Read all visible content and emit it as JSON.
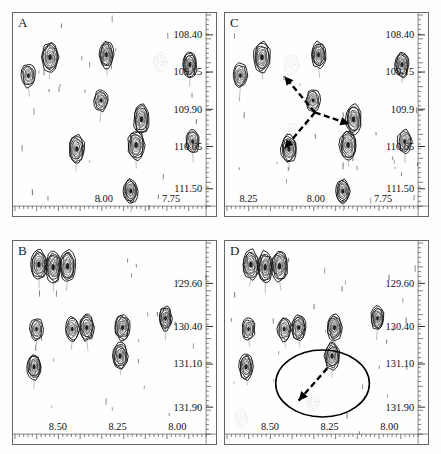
{
  "figure": {
    "background_color": "#fdfdfd",
    "contour_color": "#111111",
    "annotation_color": "#000000"
  },
  "panels": [
    {
      "letter": "A",
      "name": "panel-a",
      "x_axis": {
        "label": "",
        "ticks": [
          "8.00",
          "7.75"
        ],
        "tick_positions": [
          0.47,
          0.8
        ],
        "range": [
          8.33,
          7.62
        ]
      },
      "y_axis": {
        "label": "",
        "ticks": [
          "108.40",
          "109.15",
          "109.90",
          "110.65",
          "111.50"
        ],
        "tick_positions": [
          0.1,
          0.315,
          0.53,
          0.735,
          0.915
        ],
        "range": [
          108.0,
          111.85
        ]
      },
      "annotations": []
    },
    {
      "letter": "C",
      "name": "panel-c",
      "x_axis": {
        "label": "",
        "ticks": [
          "8.25",
          "8.00",
          "7.75"
        ],
        "tick_positions": [
          0.045,
          0.47,
          0.8
        ],
        "range": [
          8.33,
          7.62
        ]
      },
      "y_axis": {
        "label": "",
        "ticks": [
          "108.40",
          "109.15",
          "109.9",
          "110.65",
          "111.50"
        ],
        "tick_positions": [
          0.1,
          0.315,
          0.53,
          0.735,
          0.915
        ],
        "range": [
          108.0,
          111.85
        ]
      },
      "annotations": [
        {
          "type": "dashed-double-arrow",
          "name": "noe-arrow-upleft",
          "from": [
            0.46,
            0.51
          ],
          "to": [
            0.3,
            0.32
          ]
        },
        {
          "type": "dashed-double-arrow",
          "name": "noe-arrow-downleft",
          "from": [
            0.46,
            0.51
          ],
          "to": [
            0.3,
            0.7
          ]
        },
        {
          "type": "dashed-double-arrow",
          "name": "noe-arrow-right",
          "from": [
            0.46,
            0.51
          ],
          "to": [
            0.64,
            0.57
          ]
        }
      ]
    },
    {
      "letter": "B",
      "name": "panel-b",
      "x_axis": {
        "label": "",
        "ticks": [
          "8.50",
          "8.25",
          "8.00"
        ],
        "tick_positions": [
          0.18,
          0.5,
          0.8
        ],
        "range": [
          8.68,
          7.88
        ]
      },
      "y_axis": {
        "label": "",
        "ticks": [
          "129.60",
          "130.40",
          "131.10",
          "131.90"
        ],
        "tick_positions": [
          0.21,
          0.44,
          0.645,
          0.855
        ],
        "range": [
          128.85,
          132.4
        ]
      },
      "annotations": []
    },
    {
      "letter": "D",
      "name": "panel-d",
      "x_axis": {
        "label": "",
        "ticks": [
          "8.50",
          "8.25",
          "8.00"
        ],
        "tick_positions": [
          0.18,
          0.5,
          0.8
        ],
        "range": [
          8.68,
          7.88
        ]
      },
      "y_axis": {
        "label": "",
        "ticks": [
          "129.60",
          "130.40",
          "131.10",
          "131.90"
        ],
        "tick_positions": [
          0.21,
          0.44,
          0.645,
          0.855
        ],
        "range": [
          128.85,
          132.4
        ]
      },
      "annotations": [
        {
          "type": "ellipse-highlight",
          "name": "highlight-ellipse",
          "center": [
            0.5,
            0.735
          ],
          "radius": [
            0.245,
            0.175
          ]
        },
        {
          "type": "dashed-arrow",
          "name": "noe-arrow-downleft",
          "from": [
            0.525,
            0.655
          ],
          "to": [
            0.375,
            0.825
          ]
        }
      ]
    }
  ],
  "chart_data": {
    "type": "scatter",
    "title": "",
    "xlabel": "",
    "ylabel": "",
    "panels": [
      {
        "id": "A",
        "xlim": [
          8.33,
          7.62
        ],
        "ylim": [
          108.0,
          111.85
        ],
        "xticks": [
          8.0,
          7.75
        ],
        "yticks": [
          108.4,
          109.15,
          109.9,
          110.65,
          111.5
        ],
        "peaks": [
          {
            "x": 8.2,
            "y": 108.85,
            "intensity": "strong",
            "w": 17,
            "h": 30
          },
          {
            "x": 8.28,
            "y": 109.22,
            "intensity": "medium",
            "w": 14,
            "h": 24
          },
          {
            "x": 7.99,
            "y": 108.8,
            "intensity": "strong",
            "w": 14,
            "h": 27
          },
          {
            "x": 7.79,
            "y": 108.95,
            "intensity": "weak-dotted",
            "w": 14,
            "h": 20
          },
          {
            "x": 7.68,
            "y": 109.0,
            "intensity": "strong",
            "w": 14,
            "h": 26
          },
          {
            "x": 8.01,
            "y": 109.72,
            "intensity": "medium",
            "w": 14,
            "h": 22
          },
          {
            "x": 7.86,
            "y": 110.1,
            "intensity": "strong",
            "w": 16,
            "h": 30
          },
          {
            "x": 7.67,
            "y": 110.55,
            "intensity": "medium",
            "w": 14,
            "h": 24
          },
          {
            "x": 7.88,
            "y": 110.62,
            "intensity": "strong",
            "w": 17,
            "h": 30
          },
          {
            "x": 8.1,
            "y": 110.7,
            "intensity": "strong",
            "w": 16,
            "h": 28
          },
          {
            "x": 7.9,
            "y": 111.55,
            "intensity": "strong",
            "w": 14,
            "h": 24
          }
        ]
      },
      {
        "id": "C",
        "xlim": [
          8.33,
          7.62
        ],
        "ylim": [
          108.0,
          111.85
        ],
        "xticks": [
          8.25,
          8.0,
          7.75
        ],
        "yticks": [
          108.4,
          109.15,
          109.9,
          110.65,
          111.5
        ],
        "peaks": [
          {
            "x": 8.2,
            "y": 108.85,
            "intensity": "strong",
            "w": 17,
            "h": 30
          },
          {
            "x": 8.28,
            "y": 109.22,
            "intensity": "medium",
            "w": 14,
            "h": 24
          },
          {
            "x": 7.99,
            "y": 108.8,
            "intensity": "strong",
            "w": 14,
            "h": 27
          },
          {
            "x": 7.68,
            "y": 109.0,
            "intensity": "strong",
            "w": 14,
            "h": 26
          },
          {
            "x": 8.09,
            "y": 109.0,
            "intensity": "weak-dotted",
            "w": 15,
            "h": 20
          },
          {
            "x": 8.01,
            "y": 109.72,
            "intensity": "medium",
            "w": 14,
            "h": 22
          },
          {
            "x": 7.86,
            "y": 110.1,
            "intensity": "strong",
            "w": 16,
            "h": 30
          },
          {
            "x": 8.09,
            "y": 110.38,
            "intensity": "weak-dotted",
            "w": 15,
            "h": 20
          },
          {
            "x": 7.67,
            "y": 110.55,
            "intensity": "medium",
            "w": 14,
            "h": 24
          },
          {
            "x": 7.88,
            "y": 110.62,
            "intensity": "strong",
            "w": 17,
            "h": 30
          },
          {
            "x": 8.1,
            "y": 110.7,
            "intensity": "strong",
            "w": 16,
            "h": 28
          },
          {
            "x": 7.9,
            "y": 111.55,
            "intensity": "strong",
            "w": 14,
            "h": 24
          }
        ]
      },
      {
        "id": "B",
        "xlim": [
          8.68,
          7.88
        ],
        "ylim": [
          128.85,
          132.4
        ],
        "xticks": [
          8.5,
          8.25,
          8.0
        ],
        "yticks": [
          129.6,
          130.4,
          131.1,
          131.9
        ],
        "peaks": [
          {
            "x": 8.58,
            "y": 129.25,
            "intensity": "strong",
            "w": 16,
            "h": 30
          },
          {
            "x": 8.52,
            "y": 129.3,
            "intensity": "strong",
            "w": 15,
            "h": 32
          },
          {
            "x": 8.46,
            "y": 129.28,
            "intensity": "strong",
            "w": 16,
            "h": 32
          },
          {
            "x": 8.05,
            "y": 130.25,
            "intensity": "strong",
            "w": 13,
            "h": 24
          },
          {
            "x": 8.59,
            "y": 130.45,
            "intensity": "medium",
            "w": 13,
            "h": 22
          },
          {
            "x": 8.44,
            "y": 130.45,
            "intensity": "medium",
            "w": 14,
            "h": 24
          },
          {
            "x": 8.38,
            "y": 130.42,
            "intensity": "strong",
            "w": 15,
            "h": 26
          },
          {
            "x": 8.23,
            "y": 130.42,
            "intensity": "strong",
            "w": 15,
            "h": 26
          },
          {
            "x": 8.24,
            "y": 130.95,
            "intensity": "strong",
            "w": 15,
            "h": 27
          },
          {
            "x": 8.6,
            "y": 131.15,
            "intensity": "strong",
            "w": 14,
            "h": 26
          }
        ]
      },
      {
        "id": "D",
        "xlim": [
          8.68,
          7.88
        ],
        "ylim": [
          128.85,
          132.4
        ],
        "xticks": [
          8.5,
          8.25,
          8.0
        ],
        "yticks": [
          129.6,
          130.4,
          131.1,
          131.9
        ],
        "peaks": [
          {
            "x": 8.58,
            "y": 129.25,
            "intensity": "strong",
            "w": 16,
            "h": 30
          },
          {
            "x": 8.52,
            "y": 129.3,
            "intensity": "strong",
            "w": 15,
            "h": 32
          },
          {
            "x": 8.46,
            "y": 129.28,
            "intensity": "strong",
            "w": 16,
            "h": 32
          },
          {
            "x": 8.05,
            "y": 130.25,
            "intensity": "strong",
            "w": 13,
            "h": 24
          },
          {
            "x": 8.59,
            "y": 130.45,
            "intensity": "medium",
            "w": 13,
            "h": 22
          },
          {
            "x": 8.44,
            "y": 130.45,
            "intensity": "medium",
            "w": 14,
            "h": 24
          },
          {
            "x": 8.38,
            "y": 130.42,
            "intensity": "strong",
            "w": 15,
            "h": 26
          },
          {
            "x": 8.23,
            "y": 130.42,
            "intensity": "strong",
            "w": 15,
            "h": 26
          },
          {
            "x": 8.24,
            "y": 130.95,
            "intensity": "strong",
            "w": 15,
            "h": 27
          },
          {
            "x": 8.6,
            "y": 131.15,
            "intensity": "strong",
            "w": 14,
            "h": 26
          },
          {
            "x": 8.32,
            "y": 131.8,
            "intensity": "weak-dotted",
            "w": 13,
            "h": 20
          },
          {
            "x": 8.62,
            "y": 132.1,
            "intensity": "weak-dotted",
            "w": 13,
            "h": 18
          }
        ]
      }
    ]
  }
}
